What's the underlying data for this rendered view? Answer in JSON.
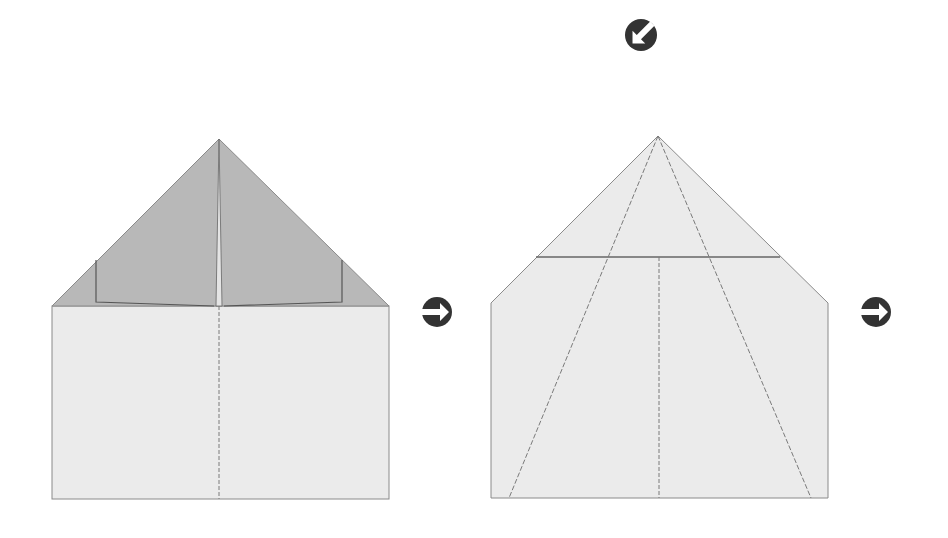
{
  "diagram": {
    "colors": {
      "paper": "#ebebeb",
      "flap": "#b8b8b8",
      "edge": "#8a8a8a",
      "flap_edge": "#555555",
      "crease": "#7a7a7a",
      "arrow": "#333333"
    },
    "steps": [
      {
        "id": "step-1",
        "description": "Top corners folded down to center line, forming a pointed top",
        "creases": [
          "center valley fold (dashed)"
        ]
      },
      {
        "id": "step-2",
        "description": "Folded point with horizontal crease and two diagonal dashed fold lines from apex to bottom edge",
        "creases": [
          "horizontal fold",
          "center dashed line",
          "left diagonal dashed line",
          "right diagonal dashed line"
        ]
      }
    ],
    "arrows": [
      {
        "id": "arrow-next-1",
        "direction": "right",
        "icon": "arrow-right-circle-icon"
      },
      {
        "id": "arrow-next-2",
        "direction": "right",
        "icon": "arrow-right-circle-icon"
      },
      {
        "id": "arrow-turn-over",
        "direction": "down-left",
        "icon": "arrow-down-left-circle-icon"
      }
    ]
  }
}
